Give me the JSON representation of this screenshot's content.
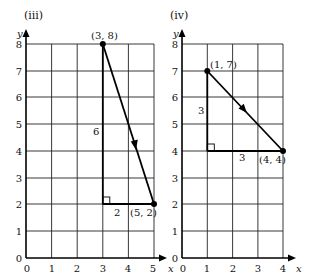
{
  "panels": [
    {
      "label": "(iii)",
      "y_axis_label": "y",
      "x_axis_label": "x",
      "x_ticks": [
        "0",
        "1",
        "2",
        "3",
        "4",
        "5"
      ],
      "y_ticks": [
        "0",
        "1",
        "2",
        "3",
        "4",
        "5",
        "6",
        "7",
        "8"
      ],
      "point_a_label": "(3, 8)",
      "point_b_label": "(5, 2)",
      "vertical_leg_label": "6",
      "horizontal_leg_label": "2"
    },
    {
      "label": "(iv)",
      "y_axis_label": "y",
      "x_axis_label": "x",
      "x_ticks": [
        "0",
        "1",
        "2",
        "3",
        "4"
      ],
      "y_ticks": [
        "0",
        "1",
        "2",
        "3",
        "4",
        "5",
        "6",
        "7",
        "8"
      ],
      "point_a_label": "(1, 7)",
      "point_b_label": "(4, 4)",
      "vertical_leg_label": "3",
      "horizontal_leg_label": "3"
    }
  ]
}
